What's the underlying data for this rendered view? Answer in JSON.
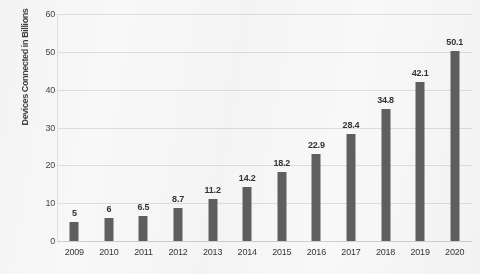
{
  "chart_data": {
    "type": "bar",
    "title": "",
    "subtitle": "",
    "xlabel": "",
    "ylabel": "Devices Connected in Billions",
    "categories": [
      "2009",
      "2010",
      "2011",
      "2012",
      "2013",
      "2014",
      "2015",
      "2016",
      "2017",
      "2018",
      "2019",
      "2020"
    ],
    "values": [
      5,
      6,
      6.5,
      8.7,
      11.2,
      14.2,
      18.2,
      22.9,
      28.4,
      34.8,
      42.1,
      50.1
    ],
    "data_labels": [
      "5",
      "6",
      "6.5",
      "8.7",
      "11.2",
      "14.2",
      "18.2",
      "22.9",
      "28.4",
      "34.8",
      "42.1",
      "50.1"
    ],
    "ylim": [
      0,
      60
    ],
    "ytick_labels": [
      "0",
      "10",
      "20",
      "30",
      "40",
      "50",
      "60"
    ],
    "ytick_values": [
      0,
      10,
      20,
      30,
      40,
      50,
      60
    ],
    "grid": true,
    "grid_axis": "y",
    "legend": false,
    "legend_position": "none",
    "bar_color": "#5c5c5c",
    "gridline_color": "#e2e2e2",
    "text_color": "#313131",
    "background_color": "#fefefe"
  }
}
